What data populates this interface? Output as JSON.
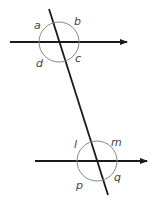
{
  "diagram": {
    "type": "parallel-lines-transversal",
    "colors": {
      "line": "#1a1a1a",
      "circle": "#888888",
      "label": "#444444"
    },
    "top_intersection": {
      "labels": {
        "a": "a",
        "b": "b",
        "c": "c",
        "d": "d"
      }
    },
    "bottom_intersection": {
      "labels": {
        "l": "l",
        "m": "m",
        "p": "p",
        "q": "q"
      }
    }
  }
}
